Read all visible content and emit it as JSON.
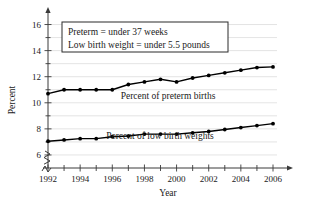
{
  "chart_data": {
    "type": "line",
    "title": "",
    "xlabel": "Year",
    "ylabel": "Percent",
    "xlim": [
      1992,
      2006
    ],
    "ylim": [
      5,
      16.5
    ],
    "y_axis_break": true,
    "grid": true,
    "legend_position": "inline-labels",
    "x": [
      1992,
      1993,
      1994,
      1995,
      1996,
      1997,
      1998,
      1999,
      2000,
      2001,
      2002,
      2003,
      2004,
      2005,
      2006
    ],
    "xtick_labels": [
      "1992",
      "1994",
      "1996",
      "1998",
      "2000",
      "2002",
      "2004",
      "2006"
    ],
    "xtick_values": [
      1992,
      1994,
      1996,
      1998,
      2000,
      2002,
      2004,
      2006
    ],
    "xtick_minor_values": [
      1993,
      1995,
      1997,
      1999,
      2001,
      2003,
      2005
    ],
    "ytick_labels": [
      "6",
      "8",
      "10",
      "12",
      "14",
      "16"
    ],
    "ytick_values": [
      6,
      8,
      10,
      12,
      14,
      16
    ],
    "ytick_minor_values": [
      7,
      9,
      11,
      13,
      15
    ],
    "series": [
      {
        "name": "Percent of preterm births",
        "label": "Percent of preterm births",
        "color": "#000000",
        "values": [
          10.7,
          11.0,
          11.0,
          11.0,
          11.0,
          11.4,
          11.6,
          11.8,
          11.6,
          11.9,
          12.1,
          12.3,
          12.5,
          12.7,
          12.75
        ]
      },
      {
        "name": "Percent of low birth weights",
        "label": "Percent of low birth weights",
        "color": "#000000",
        "values": [
          7.05,
          7.15,
          7.25,
          7.25,
          7.4,
          7.45,
          7.6,
          7.6,
          7.6,
          7.7,
          7.8,
          7.95,
          8.1,
          8.25,
          8.4
        ]
      }
    ],
    "annotations": [
      "Preterm = under 37 weeks",
      "Low birth weight = under 5.5 pounds"
    ]
  }
}
